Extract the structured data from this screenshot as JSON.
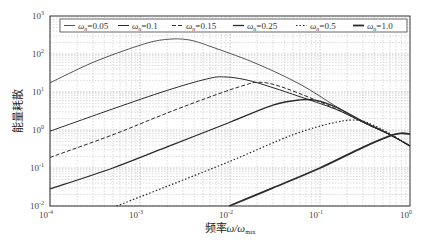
{
  "chart_data": {
    "type": "line",
    "title": "",
    "xlabel": "频率ω/ω_max",
    "ylabel": "能量耗散",
    "xscale": "log",
    "yscale": "log",
    "xlim": [
      0.0001,
      1
    ],
    "ylim": [
      0.01,
      1000
    ],
    "grid": true,
    "legend_position": "top (inside)",
    "x_ticks": [
      "10^-4",
      "10^-3",
      "10^-2",
      "10^-1",
      "10^0"
    ],
    "y_ticks": [
      "10^-2",
      "10^-1",
      "10^0",
      "10^1",
      "10^2",
      "10^3"
    ],
    "series": [
      {
        "name": "ω_n=0.05",
        "style": "thin solid",
        "width": 0.8,
        "dash": "",
        "points": [
          [
            0.0001,
            17.4
          ],
          [
            0.0003,
            60
          ],
          [
            0.001,
            170
          ],
          [
            0.0019,
            240
          ],
          [
            0.0035,
            235
          ],
          [
            0.007,
            140
          ],
          [
            0.02,
            55
          ],
          [
            0.06,
            16
          ],
          [
            0.15,
            4.2
          ],
          [
            0.3,
            1.6
          ],
          [
            0.6,
            0.75
          ],
          [
            1.0,
            0.38
          ]
        ]
      },
      {
        "name": "ω_n=0.1",
        "style": "solid",
        "width": 1.0,
        "dash": "",
        "points": [
          [
            0.0001,
            0.93
          ],
          [
            0.0005,
            3.6
          ],
          [
            0.002,
            11
          ],
          [
            0.0055,
            22
          ],
          [
            0.0085,
            25
          ],
          [
            0.015,
            21
          ],
          [
            0.03,
            13
          ],
          [
            0.06,
            7.5
          ],
          [
            0.15,
            3.5
          ],
          [
            0.3,
            1.6
          ],
          [
            0.6,
            0.75
          ],
          [
            1.0,
            0.38
          ]
        ]
      },
      {
        "name": "ω_n=0.15",
        "style": "dashed",
        "width": 1.0,
        "dash": "4,2",
        "points": [
          [
            0.0001,
            0.19
          ],
          [
            0.0005,
            0.75
          ],
          [
            0.002,
            2.8
          ],
          [
            0.007,
            8.5
          ],
          [
            0.015,
            15.5
          ],
          [
            0.02,
            18
          ],
          [
            0.03,
            16
          ],
          [
            0.06,
            9
          ],
          [
            0.15,
            3.6
          ],
          [
            0.3,
            1.6
          ],
          [
            0.6,
            0.75
          ],
          [
            1.0,
            0.38
          ]
        ]
      },
      {
        "name": "ω_n=0.25",
        "style": "medium solid",
        "width": 1.3,
        "dash": "",
        "points": [
          [
            0.0001,
            0.028
          ],
          [
            0.0005,
            0.1
          ],
          [
            0.002,
            0.36
          ],
          [
            0.01,
            1.6
          ],
          [
            0.03,
            4.5
          ],
          [
            0.06,
            6.2
          ],
          [
            0.09,
            6.0
          ],
          [
            0.15,
            4.0
          ],
          [
            0.3,
            1.7
          ],
          [
            0.6,
            0.75
          ],
          [
            1.0,
            0.38
          ]
        ]
      },
      {
        "name": "ω_n=0.5",
        "style": "dotted",
        "width": 1.2,
        "dash": "1.5,2",
        "points": [
          [
            0.00055,
            0.01
          ],
          [
            0.002,
            0.033
          ],
          [
            0.01,
            0.15
          ],
          [
            0.05,
            0.75
          ],
          [
            0.15,
            1.6
          ],
          [
            0.27,
            1.8
          ],
          [
            0.4,
            1.3
          ],
          [
            0.6,
            0.8
          ],
          [
            1.0,
            0.38
          ]
        ]
      },
      {
        "name": "ω_n=1.0",
        "style": "thick solid",
        "width": 1.8,
        "dash": "",
        "points": [
          [
            0.0098,
            0.01
          ],
          [
            0.03,
            0.03
          ],
          [
            0.1,
            0.1
          ],
          [
            0.3,
            0.35
          ],
          [
            0.6,
            0.7
          ],
          [
            0.8,
            0.82
          ],
          [
            1.0,
            0.78
          ]
        ]
      }
    ]
  },
  "axes": {
    "ylabel": "能量耗散",
    "xlabel_main": "频率",
    "xlabel_sym": "ω/ω",
    "xlabel_sub": "max",
    "x_tick_labels": [
      {
        "base": "10",
        "exp": "-4"
      },
      {
        "base": "10",
        "exp": "-3"
      },
      {
        "base": "10",
        "exp": "-2"
      },
      {
        "base": "10",
        "exp": "-1"
      },
      {
        "base": "10",
        "exp": "0"
      }
    ],
    "y_tick_labels": [
      {
        "base": "10",
        "exp": "3"
      },
      {
        "base": "10",
        "exp": "2"
      },
      {
        "base": "10",
        "exp": "1"
      },
      {
        "base": "10",
        "exp": "0"
      },
      {
        "base": "10",
        "exp": "-1"
      },
      {
        "base": "10",
        "exp": "-2"
      }
    ]
  },
  "legend": {
    "items": [
      {
        "sym": "ω",
        "sub": "n",
        "value": "=0.05"
      },
      {
        "sym": "ω",
        "sub": "n",
        "value": "=0.1"
      },
      {
        "sym": "ω",
        "sub": "n",
        "value": "=0.15"
      },
      {
        "sym": "ω",
        "sub": "n",
        "value": "=0.25"
      },
      {
        "sym": "ω",
        "sub": "n",
        "value": "=0.5"
      },
      {
        "sym": "ω",
        "sub": "n",
        "value": "=1.0"
      }
    ]
  },
  "colors": {
    "line": "#2a2a2a",
    "grid_major": "#9a9a9a",
    "grid_minor": "#c4c4c4",
    "frame": "#333333"
  }
}
